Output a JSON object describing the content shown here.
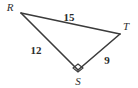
{
  "figure": {
    "kind": "right-triangle-diagram",
    "background_color": "#ffffff",
    "stroke_color": "#3b3b3b",
    "text_color": "#2e2e2e",
    "vertices": [
      {
        "name": "R",
        "label": "R",
        "x": 21,
        "y": 13,
        "label_x": 10,
        "label_y": 11
      },
      {
        "name": "T",
        "label": "T",
        "x": 120,
        "y": 34,
        "label_x": 124,
        "label_y": 30
      },
      {
        "name": "S",
        "label": "S",
        "x": 78,
        "y": 70,
        "label_x": 75,
        "label_y": 85
      }
    ],
    "sides": [
      {
        "name": "RT",
        "length_label": "15",
        "label_x": 62,
        "label_y": 21
      },
      {
        "name": "RS",
        "length_label": "12",
        "label_x": 29,
        "label_y": 54
      },
      {
        "name": "ST",
        "length_label": "9",
        "label_x": 103,
        "label_y": 65
      }
    ],
    "right_angle": {
      "at_vertex": "S",
      "marker": "square"
    }
  }
}
